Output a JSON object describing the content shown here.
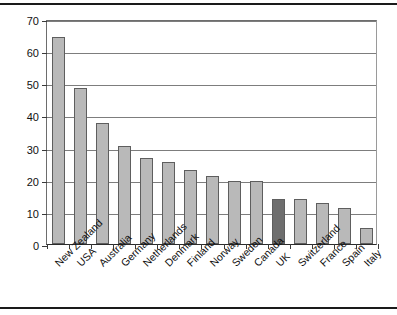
{
  "chart_data": {
    "type": "bar",
    "title": "",
    "subtitle": "",
    "xlabel": "",
    "ylabel": "",
    "ylim": [
      0,
      70
    ],
    "ytick_step": 10,
    "yticks": [
      0,
      10,
      20,
      30,
      40,
      50,
      60,
      70
    ],
    "ytick_labels": [
      "0",
      "10",
      "20",
      "30",
      "40",
      "50",
      "60",
      "70"
    ],
    "grid": "horizontal",
    "legend": "none",
    "categories": [
      "New Zealand",
      "USA",
      "Australia",
      "Germany",
      "Netherlands",
      "Denmark",
      "Finland",
      "Norway",
      "Sweden",
      "Canada",
      "UK",
      "Switzerland",
      "France",
      "Spain",
      "Italy"
    ],
    "values": [
      64.5,
      48.5,
      37.8,
      30.5,
      26.7,
      25.5,
      23.0,
      21.2,
      19.7,
      19.7,
      14.1,
      14.0,
      12.7,
      11.3,
      4.9
    ],
    "highlight_category": "UK",
    "highlight_index": 10,
    "bar_color": "#b9b9b9",
    "highlight_color": "#6e6e6e",
    "bar_border_color": "#5e5e5e",
    "grid_color": "#7d7d7d",
    "axis_color": "#2b2b2b",
    "background_color": "#ffffff"
  }
}
